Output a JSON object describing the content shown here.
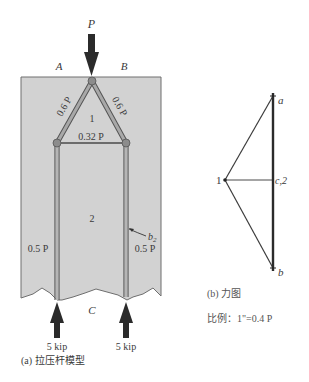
{
  "colors": {
    "block_fill": "#d2d2d2",
    "block_edge": "#6e6e6e",
    "strut": "#8a8a8a",
    "strut_edge": "#555555",
    "tie": "#4a4a4a",
    "node": "#8c8c8c",
    "arrow": "#2b2b2b",
    "force_line": "#3c3c3c"
  },
  "panel_a": {
    "load_label": "P",
    "corner_left": "A",
    "corner_right": "B",
    "bottom_label": "C",
    "region_1": "1",
    "region_2": "2",
    "strut_left_force": "0.6 P",
    "strut_right_force": "0.6 P",
    "tie_force": "0.32 P",
    "post_left_force": "0.5 P",
    "post_right_force": "0.5 P",
    "width_callout": "b",
    "width_callout_sub": "2",
    "reaction_left": "5 kip",
    "reaction_right": "5 kip",
    "caption": "(a) 拉压杆模型"
  },
  "panel_b": {
    "point_a": "a",
    "point_b": "b",
    "point_1": "1",
    "point_c2": "c,2",
    "caption": "(b) 力图",
    "scale": "比例：1\"=0.4 P"
  }
}
